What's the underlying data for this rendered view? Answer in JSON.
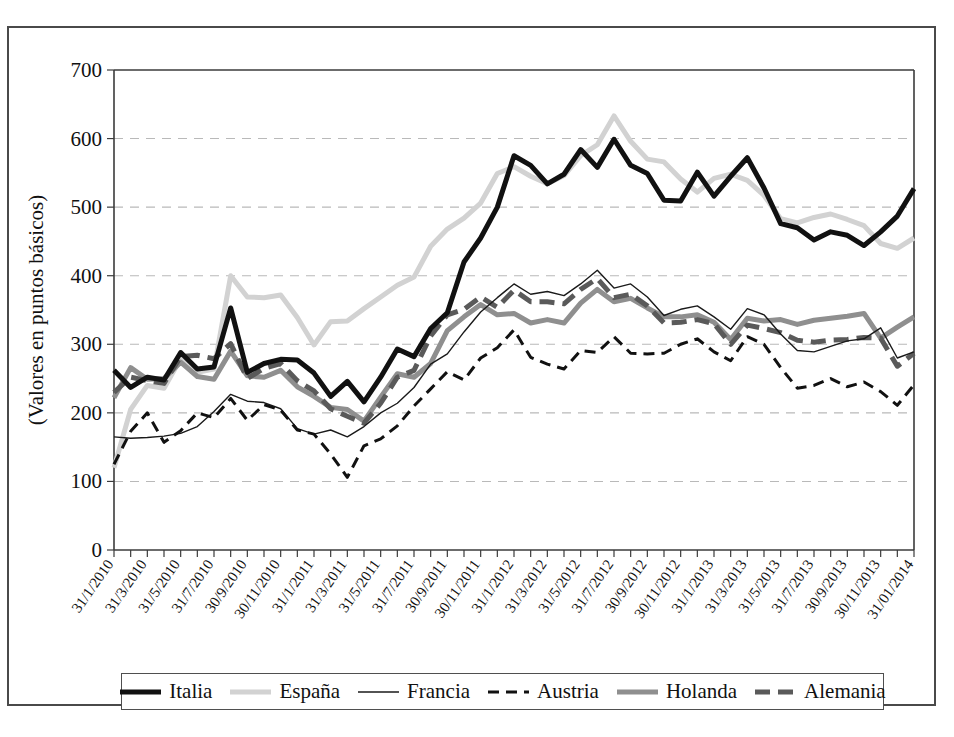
{
  "figure": {
    "y_axis_title": "(Valores en puntos básicos)"
  },
  "legend": {
    "items": [
      {
        "label": "Italia",
        "color": "#111111",
        "width": 5.0,
        "dash": "none",
        "key": "Italia"
      },
      {
        "label": "España",
        "color": "#d2d2d2",
        "width": 5.0,
        "dash": "none",
        "key": "España"
      },
      {
        "label": "Francia",
        "color": "#1a1a1a",
        "width": 1.4,
        "dash": "none",
        "key": "Francia"
      },
      {
        "label": "Austria",
        "color": "#111111",
        "width": 3.0,
        "dash": "11 7",
        "key": "Austria"
      },
      {
        "label": "Holanda",
        "color": "#8f8f8f",
        "width": 5.0,
        "dash": "none",
        "key": "Holanda"
      },
      {
        "label": "Alemania",
        "color": "#5a5a5a",
        "width": 5.0,
        "dash": "15 8",
        "key": "Alemania"
      }
    ]
  },
  "chart_data": {
    "type": "line",
    "title": "",
    "xlabel": "",
    "ylabel": "(Valores en puntos básicos)",
    "ylim": [
      0,
      700
    ],
    "ytick_values": [
      0,
      100,
      200,
      300,
      400,
      500,
      600,
      700
    ],
    "grid": true,
    "legend_position": "bottom",
    "x_tick_labels": [
      "31/1/2010",
      "31/3/2010",
      "31/5/2010",
      "31/7/2010",
      "30/9/2010",
      "30/11/2010",
      "31/1/2011",
      "31/3/2011",
      "31/5/2011",
      "31/7/2011",
      "30/9/2011",
      "30/11/2011",
      "31/1/2012",
      "31/3/2012",
      "31/5/2012",
      "31/7/2012",
      "30/9/2012",
      "30/11/2012",
      "31/1/2013",
      "31/3/2013",
      "31/5/2013",
      "31/7/2013",
      "30/9/2013",
      "30/11/2013",
      "31/01/2014"
    ],
    "x_tick_indices": [
      0,
      2,
      4,
      6,
      8,
      10,
      12,
      14,
      16,
      18,
      20,
      22,
      24,
      26,
      28,
      30,
      32,
      34,
      36,
      38,
      40,
      42,
      44,
      46,
      48
    ],
    "n_points": 49,
    "series": [
      {
        "name": "Italia",
        "values": [
          262,
          237,
          252,
          248,
          288,
          264,
          267,
          353,
          259,
          272,
          278,
          277,
          258,
          224,
          246,
          216,
          252,
          293,
          282,
          323,
          346,
          420,
          455,
          500,
          575,
          561,
          534,
          548,
          584,
          558,
          599,
          561,
          549,
          510,
          509,
          551,
          516,
          545,
          572,
          528,
          476,
          470,
          452,
          464,
          459,
          444,
          464,
          487,
          527
        ]
      },
      {
        "name": "España",
        "values": [
          120,
          205,
          240,
          236,
          279,
          259,
          264,
          400,
          369,
          368,
          372,
          339,
          299,
          333,
          334,
          352,
          369,
          386,
          398,
          443,
          468,
          484,
          506,
          549,
          559,
          545,
          534,
          546,
          575,
          591,
          633,
          596,
          570,
          566,
          541,
          522,
          542,
          548,
          539,
          517,
          483,
          477,
          485,
          490,
          482,
          473,
          447,
          440,
          455
        ]
      },
      {
        "name": "Francia",
        "values": [
          165,
          163,
          164,
          166,
          170,
          180,
          202,
          227,
          217,
          215,
          206,
          177,
          169,
          175,
          165,
          180,
          200,
          214,
          237,
          271,
          286,
          318,
          347,
          368,
          388,
          373,
          377,
          371,
          388,
          408,
          382,
          388,
          369,
          342,
          351,
          356,
          340,
          322,
          352,
          343,
          315,
          291,
          289,
          297,
          305,
          308,
          324,
          280,
          289
        ]
      },
      {
        "name": "Austria",
        "values": [
          125,
          173,
          200,
          157,
          174,
          200,
          193,
          221,
          189,
          212,
          204,
          175,
          169,
          140,
          106,
          152,
          162,
          181,
          210,
          235,
          260,
          248,
          280,
          295,
          321,
          281,
          271,
          264,
          291,
          288,
          311,
          287,
          286,
          287,
          300,
          308,
          289,
          276,
          311,
          300,
          266,
          236,
          240,
          250,
          238,
          245,
          231,
          211,
          241
        ]
      },
      {
        "name": "Holanda",
        "values": [
          222,
          266,
          249,
          250,
          274,
          253,
          249,
          290,
          254,
          252,
          262,
          238,
          224,
          208,
          205,
          188,
          223,
          257,
          252,
          272,
          320,
          340,
          358,
          343,
          345,
          331,
          336,
          331,
          360,
          380,
          362,
          367,
          353,
          340,
          340,
          343,
          332,
          307,
          338,
          334,
          336,
          329,
          335,
          338,
          341,
          345,
          309,
          325,
          340
        ]
      },
      {
        "name": "Alemania",
        "values": [
          230,
          252,
          247,
          243,
          282,
          284,
          279,
          301,
          250,
          265,
          272,
          247,
          232,
          206,
          195,
          185,
          214,
          252,
          262,
          312,
          343,
          351,
          369,
          354,
          379,
          362,
          362,
          359,
          380,
          396,
          368,
          373,
          356,
          331,
          332,
          336,
          330,
          300,
          328,
          323,
          317,
          306,
          303,
          306,
          307,
          310,
          309,
          268,
          287
        ]
      }
    ]
  }
}
